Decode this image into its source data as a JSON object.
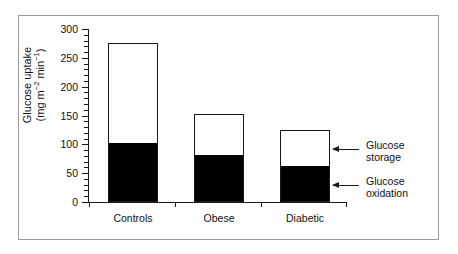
{
  "chart_data": {
    "type": "bar",
    "title": "",
    "xlabel": "",
    "ylabel": "Glucose uptake (mg m⁻² min⁻¹)",
    "ylabel_line1": "Glucose uptake",
    "ylabel_line2_prefix": "(mg m",
    "ylabel_line2_sup1": "−2",
    "ylabel_line2_mid": " min",
    "ylabel_line2_sup2": "−1",
    "ylabel_line2_suffix": ")",
    "categories": [
      "Controls",
      "Obese",
      "Diabetic"
    ],
    "ylim": [
      0,
      300
    ],
    "yticks": [
      0,
      50,
      100,
      150,
      200,
      250,
      300
    ],
    "ytick_labels": [
      "0",
      "50",
      "100",
      "150",
      "200",
      "250",
      "300"
    ],
    "minor_tick_step": 10,
    "grid": false,
    "legend_position": "right-annotations",
    "stacked": true,
    "series": [
      {
        "name": "Glucose oxidation",
        "color": "#000000",
        "values": [
          100,
          80,
          60
        ]
      },
      {
        "name": "Glucose storage",
        "color": "#ffffff",
        "values": [
          175,
          72,
          65
        ]
      }
    ],
    "totals": [
      275,
      152,
      125
    ],
    "annotations": [
      {
        "text_line1": "Glucose",
        "text_line2": "storage"
      },
      {
        "text_line1": "Glucose",
        "text_line2": "oxidation"
      }
    ]
  }
}
